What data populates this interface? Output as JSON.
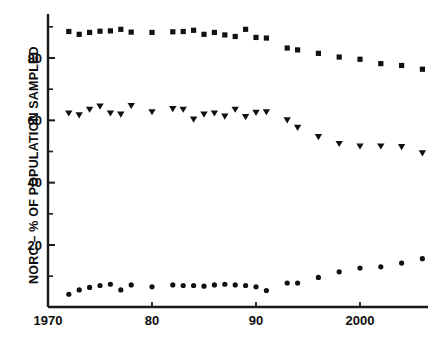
{
  "chart_data": {
    "type": "scatter",
    "title": "",
    "subtitle": "",
    "xlabel": "",
    "ylabel": "NORC – % OF POPULATION SAMPLED",
    "xlim": [
      1970.5,
      2007.5
    ],
    "ylim": [
      0,
      93
    ],
    "grid": false,
    "legend": "none",
    "x_ticks": [
      {
        "value": 1970,
        "label": "1970"
      },
      {
        "value": 1980,
        "label": "80"
      },
      {
        "value": 1990,
        "label": "90"
      },
      {
        "value": 2000,
        "label": "2000"
      }
    ],
    "x_minor_ticks": [
      1975,
      1985,
      1995,
      2005
    ],
    "y_ticks": [
      {
        "value": 20,
        "label": "20"
      },
      {
        "value": 40,
        "label": "40"
      },
      {
        "value": 60,
        "label": "60"
      },
      {
        "value": 80,
        "label": "80"
      }
    ],
    "y_minor_ticks": [
      10,
      30,
      50,
      70,
      90
    ],
    "series": [
      {
        "name": "top-series",
        "marker": "square",
        "color": "#111111",
        "points": [
          {
            "x": 1972,
            "y": 88.5
          },
          {
            "x": 1973,
            "y": 87.6
          },
          {
            "x": 1974,
            "y": 88.2
          },
          {
            "x": 1975,
            "y": 88.6
          },
          {
            "x": 1976,
            "y": 88.7
          },
          {
            "x": 1977,
            "y": 89.2
          },
          {
            "x": 1978,
            "y": 88.3
          },
          {
            "x": 1980,
            "y": 88.2
          },
          {
            "x": 1982,
            "y": 88.4
          },
          {
            "x": 1983,
            "y": 88.5
          },
          {
            "x": 1984,
            "y": 88.9
          },
          {
            "x": 1985,
            "y": 87.6
          },
          {
            "x": 1986,
            "y": 88.2
          },
          {
            "x": 1987,
            "y": 87.4
          },
          {
            "x": 1988,
            "y": 86.9
          },
          {
            "x": 1989,
            "y": 89.2
          },
          {
            "x": 1990,
            "y": 86.6
          },
          {
            "x": 1991,
            "y": 86.4
          },
          {
            "x": 1993,
            "y": 83.2
          },
          {
            "x": 1994,
            "y": 82.6
          },
          {
            "x": 1996,
            "y": 81.5
          },
          {
            "x": 1998,
            "y": 80.3
          },
          {
            "x": 2000,
            "y": 79.6
          },
          {
            "x": 2002,
            "y": 78.2
          },
          {
            "x": 2004,
            "y": 77.6
          },
          {
            "x": 2006,
            "y": 76.4
          }
        ]
      },
      {
        "name": "middle-series",
        "marker": "triangle-down",
        "color": "#111111",
        "points": [
          {
            "x": 1972,
            "y": 62.2
          },
          {
            "x": 1973,
            "y": 61.6
          },
          {
            "x": 1974,
            "y": 63.4
          },
          {
            "x": 1975,
            "y": 64.4
          },
          {
            "x": 1976,
            "y": 62.2
          },
          {
            "x": 1977,
            "y": 61.8
          },
          {
            "x": 1978,
            "y": 64.6
          },
          {
            "x": 1980,
            "y": 62.6
          },
          {
            "x": 1982,
            "y": 63.6
          },
          {
            "x": 1983,
            "y": 63.4
          },
          {
            "x": 1984,
            "y": 60.2
          },
          {
            "x": 1985,
            "y": 61.8
          },
          {
            "x": 1986,
            "y": 62.2
          },
          {
            "x": 1987,
            "y": 61.2
          },
          {
            "x": 1988,
            "y": 63.4
          },
          {
            "x": 1989,
            "y": 61.0
          },
          {
            "x": 1990,
            "y": 62.4
          },
          {
            "x": 1991,
            "y": 62.6
          },
          {
            "x": 1993,
            "y": 60.0
          },
          {
            "x": 1994,
            "y": 57.6
          },
          {
            "x": 1996,
            "y": 54.6
          },
          {
            "x": 1998,
            "y": 52.4
          },
          {
            "x": 2000,
            "y": 51.6
          },
          {
            "x": 2002,
            "y": 51.6
          },
          {
            "x": 2004,
            "y": 51.4
          },
          {
            "x": 2006,
            "y": 49.4
          }
        ]
      },
      {
        "name": "bottom-series",
        "marker": "circle",
        "color": "#111111",
        "points": [
          {
            "x": 1972,
            "y": 4.2
          },
          {
            "x": 1973,
            "y": 5.6
          },
          {
            "x": 1974,
            "y": 6.4
          },
          {
            "x": 1975,
            "y": 7.0
          },
          {
            "x": 1976,
            "y": 7.4
          },
          {
            "x": 1977,
            "y": 5.6
          },
          {
            "x": 1978,
            "y": 7.2
          },
          {
            "x": 1980,
            "y": 6.6
          },
          {
            "x": 1982,
            "y": 7.2
          },
          {
            "x": 1983,
            "y": 7.0
          },
          {
            "x": 1984,
            "y": 7.0
          },
          {
            "x": 1985,
            "y": 6.8
          },
          {
            "x": 1986,
            "y": 7.2
          },
          {
            "x": 1987,
            "y": 7.4
          },
          {
            "x": 1988,
            "y": 7.2
          },
          {
            "x": 1989,
            "y": 7.0
          },
          {
            "x": 1990,
            "y": 6.6
          },
          {
            "x": 1991,
            "y": 5.4
          },
          {
            "x": 1993,
            "y": 7.8
          },
          {
            "x": 1994,
            "y": 7.8
          },
          {
            "x": 1996,
            "y": 9.6
          },
          {
            "x": 1998,
            "y": 11.4
          },
          {
            "x": 2000,
            "y": 12.6
          },
          {
            "x": 2002,
            "y": 13.0
          },
          {
            "x": 2004,
            "y": 14.2
          },
          {
            "x": 2006,
            "y": 15.6
          }
        ]
      }
    ]
  }
}
